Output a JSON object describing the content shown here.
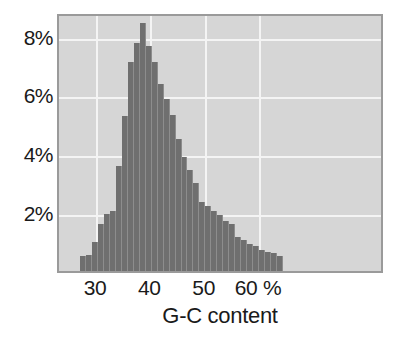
{
  "chart_data": {
    "type": "bar",
    "title": "",
    "subtitle": "",
    "xlabel": "G-C content",
    "ylabel": "",
    "grid": true,
    "legend": null,
    "xlim": [
      23.0,
      83.0
    ],
    "ylim": [
      0.0,
      8.8
    ],
    "x_unit": "%",
    "y_unit": "%",
    "x_tick_labels": [
      "30",
      "40",
      "50",
      "60 %"
    ],
    "x_tick_values": [
      30,
      40,
      50,
      60
    ],
    "y_tick_labels": [
      "2%",
      "4%",
      "6%",
      "8%"
    ],
    "y_tick_values": [
      2,
      4,
      6,
      8
    ],
    "bar_width": 1.1,
    "categories": [
      25.2,
      26.3,
      27.4,
      28.5,
      29.6,
      30.7,
      31.8,
      32.9,
      34.0,
      35.1,
      36.2,
      37.3,
      38.4,
      39.5,
      40.6,
      41.7,
      42.8,
      43.9,
      45.0,
      46.1,
      47.2,
      48.3,
      49.4,
      50.5,
      51.6,
      52.7,
      53.8,
      54.9,
      56.0,
      57.1,
      58.2,
      59.3,
      60.4,
      61.5,
      62.6,
      63.7
    ],
    "values": [
      0.0,
      0.0,
      0.52,
      0.53,
      0.98,
      1.6,
      1.95,
      2.05,
      3.57,
      5.27,
      7.1,
      7.76,
      8.42,
      7.65,
      7.1,
      6.35,
      5.85,
      5.31,
      4.5,
      3.86,
      3.44,
      3.0,
      2.35,
      2.22,
      2.03,
      1.92,
      1.7,
      1.6,
      1.15,
      1.07,
      0.92,
      0.85,
      0.72,
      0.63,
      0.6,
      0.52
    ],
    "colors": {
      "bar_fill": "#6f6f6f",
      "bar_edge": "#8d8d8d",
      "plot_background": "#d6d6d6",
      "gridline": "#f4f4f4",
      "frame": "#9a9a9a",
      "text": "#1a1a1a",
      "page_background": "#ffffff"
    }
  },
  "axes": {
    "x_title": "G-C content",
    "y_ticks": [
      {
        "label": "8%",
        "value": 8
      },
      {
        "label": "6%",
        "value": 6
      },
      {
        "label": "4%",
        "value": 4
      },
      {
        "label": "2%",
        "value": 2
      }
    ],
    "x_ticks": [
      {
        "label": "30",
        "value": 30
      },
      {
        "label": "40",
        "value": 40
      },
      {
        "label": "50",
        "value": 50
      },
      {
        "label": "60 %",
        "value": 60
      }
    ]
  }
}
